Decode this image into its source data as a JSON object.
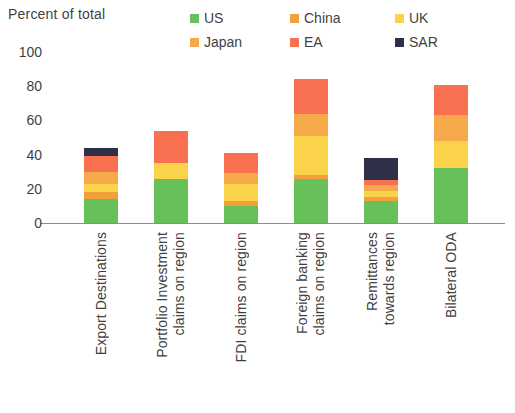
{
  "header": {
    "y_axis_title": "Percent of total"
  },
  "legend": {
    "items": [
      {
        "label": "US",
        "color": "#68c05a"
      },
      {
        "label": "China",
        "color": "#f2a03c"
      },
      {
        "label": "UK",
        "color": "#fbd34a"
      },
      {
        "label": "Japan",
        "color": "#f5a94a"
      },
      {
        "label": "EA",
        "color": "#f8704f"
      },
      {
        "label": "SAR",
        "color": "#2e3047"
      }
    ]
  },
  "chart_data": {
    "type": "bar",
    "title": "",
    "subtitle": "",
    "xlabel": "",
    "ylabel": "Percent of total",
    "ylim": [
      0,
      100
    ],
    "yticks": [
      0,
      20,
      40,
      60,
      80,
      100
    ],
    "grid": false,
    "stacked": true,
    "legend_position": "top-right",
    "categories": [
      [
        "Export Destinations"
      ],
      [
        "Portfolio Investment",
        "claims on region"
      ],
      [
        "FDI claims on region"
      ],
      [
        "Foreign banking",
        "claims on region"
      ],
      [
        "Remittances",
        "towards region"
      ],
      [
        "Bilateral ODA"
      ]
    ],
    "category_labels": [
      "Export Destinations",
      "Portfolio Investment claims on region",
      "FDI claims on region",
      "Foreign banking claims on region",
      "Remittances towards region",
      "Bilateral ODA"
    ],
    "series": [
      {
        "name": "US",
        "color": "#68c05a",
        "values": [
          14,
          26,
          10,
          26,
          13,
          32
        ]
      },
      {
        "name": "China",
        "color": "#f2a03c",
        "values": [
          4,
          0,
          3,
          2,
          2,
          0
        ]
      },
      {
        "name": "UK",
        "color": "#fbd34a",
        "values": [
          5,
          9,
          10,
          23,
          4,
          16
        ]
      },
      {
        "name": "Japan",
        "color": "#f5a94a",
        "values": [
          7,
          0,
          6,
          13,
          3,
          15
        ]
      },
      {
        "name": "EA",
        "color": "#f8704f",
        "values": [
          9,
          19,
          12,
          20,
          3,
          18
        ]
      },
      {
        "name": "SAR",
        "color": "#2e3047",
        "values": [
          5,
          0,
          0,
          0,
          13,
          0
        ]
      }
    ],
    "totals": [
      44,
      54,
      41,
      84,
      38,
      81
    ]
  }
}
